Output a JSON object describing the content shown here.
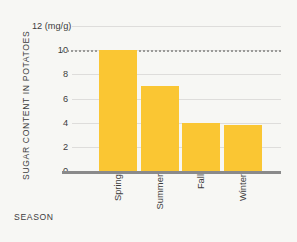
{
  "chart_data": {
    "type": "bar",
    "title": "",
    "subtitle": "",
    "categories": [
      "Spring",
      "Summer",
      "Fall",
      "Winter"
    ],
    "values": [
      10,
      7,
      4,
      3.8
    ],
    "series": [
      {
        "name": "Sugar content in potatoes",
        "values": [
          10,
          7,
          4,
          3.8
        ]
      }
    ],
    "xlabel": "SEASON",
    "ylabel": "SUGAR CONTENT IN POTATOES",
    "yunit": "(mg/g)",
    "ylim": [
      0,
      12
    ],
    "ytick_labels": [
      "12",
      "10",
      "8",
      "6",
      "4",
      "2",
      "0"
    ],
    "ytick_values": [
      12,
      10,
      8,
      6,
      4,
      2,
      0
    ],
    "grid": true,
    "legend": "none",
    "annotations": [
      {
        "type": "reference-line",
        "style": "dotted",
        "y": 10,
        "label": ""
      }
    ],
    "colors": {
      "bar": "#fac633",
      "background": "#f7f7f4",
      "gridline": "#dedddb",
      "baseline": "#8a8a8a",
      "reference_line": "#9b9b99",
      "text": "#3c3c3c"
    }
  }
}
